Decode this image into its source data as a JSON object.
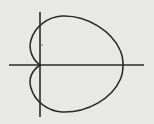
{
  "figure": {
    "type": "polar-curve",
    "curve": "cardioid",
    "colors": {
      "background": "#e8e8e6",
      "ink": "#2a2a2a"
    },
    "axes": {
      "x_axis": {
        "x1": 9,
        "y1": 65,
        "x2": 144,
        "y2": 65
      },
      "y_axis": {
        "x1": 40,
        "y1": 12,
        "x2": 40,
        "y2": 117
      }
    },
    "cusp": {
      "x": 40,
      "y": 65
    },
    "tick_mark": {
      "x": 42,
      "y": 45
    },
    "labels": []
  }
}
